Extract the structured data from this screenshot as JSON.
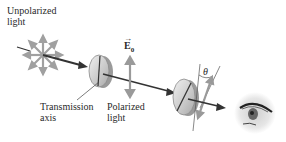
{
  "diagram": {
    "labels": {
      "unpolarized_line1": "Unpolarized",
      "unpolarized_line2": "light",
      "transmission_line1": "Transmission",
      "transmission_line2": "axis",
      "polarized_line1": "Polarized",
      "polarized_line2": "light",
      "field_vector": "E",
      "field_subscript": "0",
      "angle": "θ"
    },
    "components": [
      {
        "name": "unpolarized-source",
        "type": "starburst",
        "rays": 8
      },
      {
        "name": "polarizer",
        "type": "disk",
        "axis": "vertical"
      },
      {
        "name": "analyzer",
        "type": "disk",
        "axis": "tilted by θ"
      },
      {
        "name": "observer",
        "type": "eye"
      }
    ],
    "colors": {
      "beam": "#333333",
      "arrows": "#9a9a9a",
      "disk_fill": "#d8d8d8",
      "disk_edge": "#7a7a7a",
      "text": "#2a2a2a"
    }
  }
}
